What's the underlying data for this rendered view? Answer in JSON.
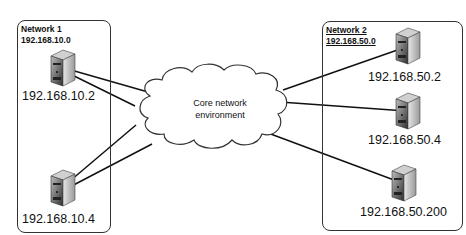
{
  "diagram": {
    "cloud": {
      "label_line1": "Core network",
      "label_line2": "environment"
    },
    "network1": {
      "title": "Network 1",
      "subnet": "192.168.10.0",
      "hosts": [
        {
          "ip": "192.168.10.2"
        },
        {
          "ip": "192.168.10.4"
        }
      ]
    },
    "network2": {
      "title": "Network 2",
      "subnet": "192.168.50.0",
      "hosts": [
        {
          "ip": "192.168.50.2"
        },
        {
          "ip": "192.168.50.4"
        },
        {
          "ip": "192.168.50.200"
        }
      ]
    },
    "colors": {
      "line": "#111111",
      "box_border": "#333333",
      "server_dark": "#3a3a3a",
      "server_light": "#d9d9d9"
    }
  }
}
